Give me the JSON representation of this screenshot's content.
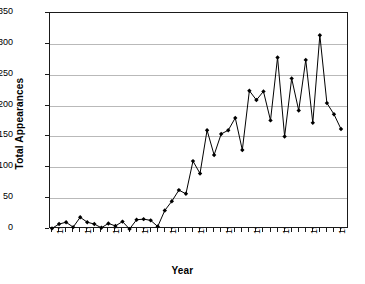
{
  "chart_data": {
    "type": "line",
    "title": "",
    "xlabel": "Year",
    "ylabel": "Total Appearances",
    "xlim": [
      1953,
      1994
    ],
    "ylim": [
      0,
      350
    ],
    "ytick_step": 50,
    "yticks": [
      0,
      50,
      100,
      150,
      200,
      250,
      300,
      350
    ],
    "xticks_labeled": [
      1953,
      1957,
      1961,
      1965,
      1969,
      1973,
      1977,
      1981,
      1985,
      1989,
      1993
    ],
    "xtick_label_interval": 4,
    "grid": "horizontal",
    "legend": "none",
    "marker": "diamond",
    "line_color": "#000000",
    "marker_color": "#000000",
    "grid_color": "#b9b9b9",
    "axis_color": "#1a1a1a",
    "background": "#ffffff",
    "x": [
      1953,
      1954,
      1955,
      1956,
      1957,
      1958,
      1959,
      1960,
      1961,
      1962,
      1963,
      1964,
      1965,
      1966,
      1967,
      1968,
      1969,
      1970,
      1971,
      1972,
      1973,
      1974,
      1975,
      1976,
      1977,
      1978,
      1979,
      1980,
      1981,
      1982,
      1983,
      1984,
      1985,
      1986,
      1987,
      1988,
      1989,
      1990,
      1991,
      1992,
      1993,
      1994
    ],
    "categories": [
      "1953",
      "1954",
      "1955",
      "1956",
      "1957",
      "1958",
      "1959",
      "1960",
      "1961",
      "1962",
      "1963",
      "1964",
      "1965",
      "1966",
      "1967",
      "1968",
      "1969",
      "1970",
      "1971",
      "1972",
      "1973",
      "1974",
      "1975",
      "1976",
      "1977",
      "1978",
      "1979",
      "1980",
      "1981",
      "1982",
      "1983",
      "1984",
      "1985",
      "1986",
      "1987",
      "1988",
      "1989",
      "1990",
      "1991",
      "1992",
      "1993",
      "1994"
    ],
    "values": [
      1,
      8,
      11,
      3,
      19,
      11,
      8,
      2,
      9,
      5,
      12,
      0,
      15,
      16,
      14,
      4,
      30,
      45,
      63,
      57,
      110,
      90,
      160,
      120,
      154,
      160,
      180,
      128,
      224,
      209,
      223,
      176,
      278,
      150,
      244,
      192,
      274,
      172,
      314,
      204,
      186,
      162
    ],
    "series": [
      {
        "name": "Total Appearances",
        "values": [
          1,
          8,
          11,
          3,
          19,
          11,
          8,
          2,
          9,
          5,
          12,
          0,
          15,
          16,
          14,
          4,
          30,
          45,
          63,
          57,
          110,
          90,
          160,
          120,
          154,
          160,
          180,
          128,
          224,
          209,
          223,
          176,
          278,
          150,
          244,
          192,
          274,
          172,
          314,
          204,
          186,
          162
        ]
      }
    ]
  }
}
